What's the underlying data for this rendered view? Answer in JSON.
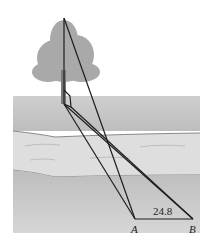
{
  "diagram": {
    "distance_label": "24.8",
    "point_a_label": "A",
    "point_b_label": "B",
    "colors": {
      "ground_far": "#c4c4c4",
      "river": "#dcdcdc",
      "ground_near": "#c9c9c9",
      "tree": "#a8a8a8",
      "lines": "#1e1e1e"
    }
  }
}
